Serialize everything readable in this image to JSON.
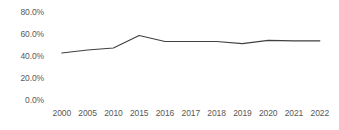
{
  "chart_data": {
    "type": "line",
    "title": "",
    "subtitle": "",
    "xlabel": "",
    "ylabel": "",
    "categories": [
      "2000",
      "2005",
      "2010",
      "2015",
      "2016",
      "2017",
      "2018",
      "2019",
      "2020",
      "2021",
      "2022"
    ],
    "values": [
      43.0,
      45.7,
      47.5,
      59.0,
      53.5,
      53.5,
      53.5,
      51.5,
      54.5,
      54.0,
      54.0
    ],
    "series": [
      {
        "name": "",
        "values": [
          43.0,
          45.7,
          47.5,
          59.0,
          53.5,
          53.5,
          53.5,
          51.5,
          54.5,
          54.0,
          54.0
        ],
        "color": "#404040"
      }
    ],
    "ylim": [
      0,
      80
    ],
    "ytick_labels": [
      "80.0%",
      "60.0%",
      "40.0%",
      "20.0%",
      "0.0%"
    ],
    "ytick_values": [
      80,
      60,
      40,
      20,
      0
    ],
    "xtick_labels": [
      "2000",
      "2005",
      "2010",
      "2015",
      "2016",
      "2017",
      "2018",
      "2019",
      "2020",
      "2021",
      "2022"
    ],
    "grid": false,
    "legend": false,
    "legend_position": "none",
    "annotations": []
  },
  "colors": {
    "line": "#404040",
    "tick_label": "#585858",
    "background": "#ffffff"
  }
}
